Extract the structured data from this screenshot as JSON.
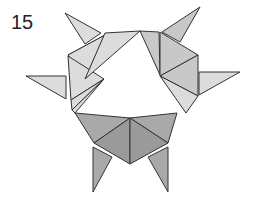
{
  "diagram": {
    "step_number": "15",
    "colors": {
      "light_face": "#dcdcdc",
      "mid_face": "#c8c8c8",
      "dark_face": "#a9a9a9",
      "outline": "#333333",
      "background": "#ffffff"
    }
  }
}
